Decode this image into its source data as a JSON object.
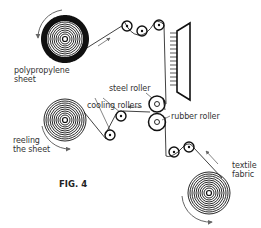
{
  "figure": {
    "caption": "FIG. 4",
    "labels": {
      "polypropylene_line1": "polypropylene",
      "polypropylene_line2": "sheet",
      "steel_roller": "steel roller",
      "cooling_rollers": "cooling rollers",
      "rubber_roller": "rubber roller",
      "reeling_line1": "reeling",
      "reeling_line2": "the sheet",
      "textile_line1": "textile",
      "textile_line2": "fabric"
    },
    "colors": {
      "line": "#111111",
      "arrow": "#666666",
      "text": "#333333"
    }
  }
}
